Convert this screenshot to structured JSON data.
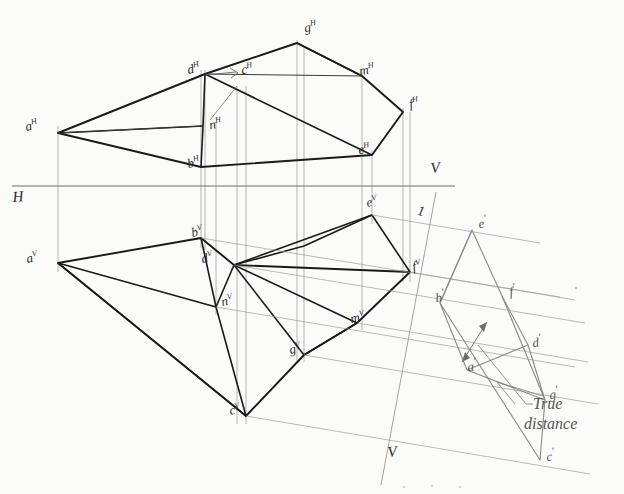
{
  "figure": {
    "reference_lines": {
      "h_label": "H",
      "v_label": "V",
      "aux_label_top": "1",
      "aux_label_bottom": "V"
    },
    "annotations": {
      "true_distance_line1": "True",
      "true_distance_line2": "distance"
    },
    "labels_horizontal_view": [
      {
        "id": "aH",
        "base": "a",
        "sup": "H",
        "x": 24,
        "y": 120,
        "rot": -12
      },
      {
        "id": "dH",
        "base": "d",
        "sup": "H",
        "x": 186,
        "y": 63,
        "rot": -12
      },
      {
        "id": "cH",
        "base": "c",
        "sup": "H",
        "x": 240,
        "y": 63,
        "rot": -10
      },
      {
        "id": "gH",
        "base": "g",
        "sup": "H",
        "x": 303,
        "y": 21,
        "rot": -10
      },
      {
        "id": "mH",
        "base": "m",
        "sup": "H",
        "x": 358,
        "y": 64,
        "rot": -10
      },
      {
        "id": "fH",
        "base": "f",
        "sup": "H",
        "x": 408,
        "y": 97,
        "rot": -10
      },
      {
        "id": "eH",
        "base": "e",
        "sup": "H",
        "x": 357,
        "y": 143,
        "rot": -10
      },
      {
        "id": "nH",
        "base": "n",
        "sup": "H",
        "x": 189,
        "y": 122,
        "rot": -10
      },
      {
        "id": "bH",
        "base": "b",
        "sup": "H",
        "x": 186,
        "y": 157,
        "rot": -12
      }
    ],
    "labels_vertical_view": [
      {
        "id": "aV",
        "base": "a",
        "sup": "V",
        "x": 25,
        "y": 252,
        "rot": -12
      },
      {
        "id": "bV",
        "base": "b",
        "sup": "V",
        "x": 190,
        "y": 228,
        "rot": -12
      },
      {
        "id": "dV",
        "base": "d",
        "sup": "V",
        "x": 198,
        "y": 253,
        "rot": -12
      },
      {
        "id": "nV",
        "base": "n",
        "sup": "V",
        "x": 218,
        "y": 295,
        "rot": -12
      },
      {
        "id": "cV",
        "base": "c",
        "sup": "V",
        "x": 228,
        "y": 404,
        "rot": -12
      },
      {
        "id": "gV",
        "base": "g",
        "sup": "V",
        "x": 288,
        "y": 343,
        "rot": -12
      },
      {
        "id": "mV",
        "base": "m",
        "sup": "V",
        "x": 349,
        "y": 312,
        "rot": -12
      },
      {
        "id": "fV",
        "base": "f",
        "sup": "V",
        "x": 408,
        "y": 262,
        "rot": -12
      },
      {
        "id": "eV",
        "base": "e",
        "sup": "V",
        "x": 365,
        "y": 197,
        "rot": -12
      }
    ],
    "labels_auxiliary_view": [
      {
        "id": "ep",
        "base": "e",
        "sup": "'",
        "x": 476,
        "y": 215,
        "rot": -8
      },
      {
        "id": "fp",
        "base": "f",
        "sup": "'",
        "x": 508,
        "y": 283,
        "rot": -8
      },
      {
        "id": "bp",
        "base": "b",
        "sup": "'",
        "x": 432,
        "y": 289,
        "rot": -8
      },
      {
        "id": "dp",
        "base": "d",
        "sup": "'",
        "x": 530,
        "y": 333,
        "rot": -8
      },
      {
        "id": "ap",
        "base": "a",
        "sup": "'",
        "x": 466,
        "y": 358,
        "rot": -8
      },
      {
        "id": "gp",
        "base": "g",
        "sup": "'",
        "x": 548,
        "y": 385,
        "rot": -8
      },
      {
        "id": "cp",
        "base": "c",
        "sup": "'",
        "x": 545,
        "y": 448,
        "rot": -8
      }
    ],
    "colors": {
      "object_line": "#1a1a1a",
      "thin_line": "#6d6d6d",
      "aux_line": "#8c8c8c",
      "projector": "#8f8f8f",
      "paper": "#fbfbf9"
    },
    "geometry": {
      "h_view_points": {
        "a": [
          58,
          133
        ],
        "d": [
          205,
          74
        ],
        "c": [
          237,
          90
        ],
        "g": [
          297,
          43
        ],
        "m": [
          362,
          76
        ],
        "f": [
          403,
          112
        ],
        "e": [
          372,
          155
        ],
        "n": [
          203,
          126
        ],
        "b": [
          201,
          167
        ]
      },
      "v_view_points": {
        "a": [
          58,
          263
        ],
        "b": [
          201,
          238
        ],
        "d": [
          234,
          265
        ],
        "n": [
          216,
          307
        ],
        "c": [
          246,
          416
        ],
        "g": [
          304,
          355
        ],
        "m": [
          357,
          323
        ],
        "f": [
          410,
          272
        ],
        "e": [
          372,
          215
        ]
      },
      "aux_view_points": {
        "e": [
          472,
          230
        ],
        "f": [
          502,
          296
        ],
        "b": [
          440,
          303
        ],
        "d": [
          528,
          345
        ],
        "a": [
          467,
          370
        ],
        "g": [
          545,
          400
        ],
        "c": [
          540,
          460
        ]
      },
      "hv_line": {
        "x1": 12,
        "y1": 186,
        "x2": 455,
        "y2": 186
      },
      "aux_line": {
        "x1": 413,
        "y1": 240,
        "x2": 432,
        "y2": 196
      },
      "aux_line2": {
        "x1": 378,
        "y1": 432,
        "x2": 400,
        "y2": 472
      }
    }
  }
}
